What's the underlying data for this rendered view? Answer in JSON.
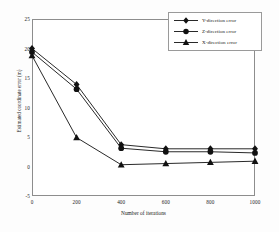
{
  "chart_data": {
    "type": "line",
    "title": "",
    "xlabel": "Number of iterations",
    "ylabel": "Estimated coordinate error (m)",
    "xlim": [
      0,
      1000
    ],
    "ylim": [
      -5,
      25
    ],
    "xticks": [
      "0",
      "200",
      "400",
      "600",
      "800",
      "1000"
    ],
    "xtick_values": [
      0,
      200,
      400,
      600,
      800,
      1000
    ],
    "yticks": [
      "25",
      "20",
      "15",
      "10",
      "5",
      "0",
      "-5"
    ],
    "ytick_values": [
      25,
      20,
      15,
      10,
      5,
      0,
      -5
    ],
    "grid": false,
    "legend_position": "upper right",
    "x": [
      0,
      200,
      400,
      600,
      800,
      1000
    ],
    "series": [
      {
        "name": "Y-direction error",
        "marker": "diamond",
        "color": "#111111",
        "values": [
          20.0,
          13.9,
          3.7,
          3.0,
          3.0,
          3.0
        ]
      },
      {
        "name": "Z-direction error",
        "marker": "circle",
        "color": "#111111",
        "values": [
          19.4,
          13.1,
          3.1,
          2.5,
          2.5,
          2.3
        ]
      },
      {
        "name": "X-direction error",
        "marker": "triangle",
        "color": "#111111",
        "values": [
          18.8,
          4.9,
          0.3,
          0.5,
          0.7,
          0.9
        ]
      }
    ]
  },
  "legend": {
    "items": [
      {
        "label": "Y-direction error",
        "marker": "diamond"
      },
      {
        "label": "Z-direction error",
        "marker": "circle"
      },
      {
        "label": "X-direction error",
        "marker": "triangle"
      }
    ]
  },
  "colors": {
    "line": "#111111",
    "frame": "#8d8d8d",
    "background": "#ffffff",
    "text": "#1a1a1a"
  }
}
